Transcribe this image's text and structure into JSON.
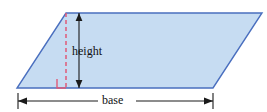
{
  "figure": {
    "name": "parallelogram-area-diagram",
    "shape": {
      "type": "parallelogram",
      "vertices": [
        {
          "x": 66,
          "y": 13
        },
        {
          "x": 262,
          "y": 13
        },
        {
          "x": 213,
          "y": 88
        },
        {
          "x": 17,
          "y": 88
        }
      ],
      "fill_color": "#c6dcf2",
      "stroke_color": "#4a6fbf",
      "stroke_width": 1.4
    },
    "labels": {
      "height": "height",
      "base": "base"
    },
    "annotations": {
      "height_segment": {
        "name": "height-dashed-line",
        "style": "dashed",
        "color": "#e05a78",
        "x": 66,
        "y_top": 13,
        "y_bottom": 88
      },
      "height_arrow": {
        "name": "height-double-arrow",
        "color": "#1a1a1a",
        "x": 79,
        "y_top": 13,
        "y_bottom": 88
      },
      "right_angle_marker": {
        "name": "right-angle-marker",
        "color": "#e05a78",
        "x": 57,
        "y": 79,
        "size": 9
      },
      "base_dimension": {
        "name": "base-dimension-line",
        "color": "#1a1a1a",
        "x_left": 18,
        "x_right": 213,
        "y": 101
      }
    },
    "colors": {
      "background": "#ffffff",
      "shape_fill": "#c6dcf2",
      "shape_stroke": "#4a6fbf",
      "accent_pink": "#e05a78",
      "ink": "#1a1a1a"
    }
  }
}
